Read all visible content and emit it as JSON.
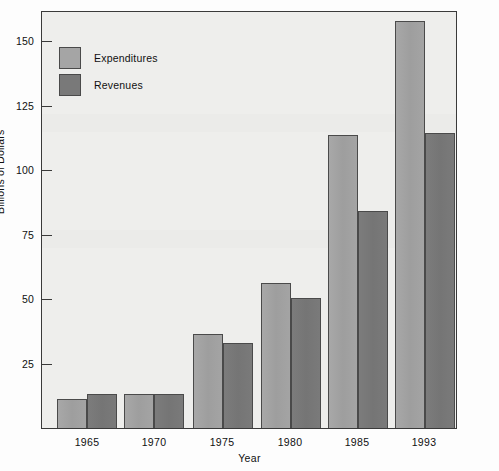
{
  "chart_data": {
    "type": "bar",
    "title": "",
    "xlabel": "Year",
    "ylabel": "Billions of Dollars",
    "categories": [
      "1965",
      "1970",
      "1975",
      "1980",
      "1985",
      "1993"
    ],
    "series": [
      {
        "name": "Expenditures",
        "color": "#a5a5a5",
        "values": [
          12,
          14,
          37,
          57,
          114,
          158
        ]
      },
      {
        "name": "Revenues",
        "color": "#797979",
        "values": [
          14,
          14,
          33.5,
          51,
          84.5,
          115
        ]
      }
    ],
    "ylim": [
      0,
      165
    ],
    "yticks": [
      25,
      50,
      75,
      100,
      125,
      150
    ],
    "ytick_labels": [
      "25",
      "50",
      "75",
      "100",
      "125",
      "150"
    ],
    "grid": false,
    "legend_position": "upper-left-inside",
    "plot_background": "#eeeeec",
    "frame_color": "#3a3a3a"
  },
  "legend": {
    "items": [
      {
        "label": "Expenditures",
        "swatch": "light"
      },
      {
        "label": "Revenues",
        "swatch": "dark"
      }
    ]
  }
}
